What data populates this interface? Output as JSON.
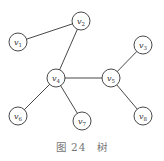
{
  "diagram": {
    "type": "tree",
    "caption": "图 24　树",
    "nodes": [
      {
        "id": "v1",
        "label": "v",
        "sub": "1",
        "x": 18,
        "y": 42
      },
      {
        "id": "v2",
        "label": "v",
        "sub": "2",
        "x": 81,
        "y": 21
      },
      {
        "id": "v3",
        "label": "v",
        "sub": "3",
        "x": 143,
        "y": 45
      },
      {
        "id": "v4",
        "label": "v",
        "sub": "4",
        "x": 56,
        "y": 78
      },
      {
        "id": "v5",
        "label": "v",
        "sub": "5",
        "x": 111,
        "y": 78
      },
      {
        "id": "v6",
        "label": "v",
        "sub": "6",
        "x": 18,
        "y": 116
      },
      {
        "id": "v7",
        "label": "v",
        "sub": "7",
        "x": 82,
        "y": 121
      },
      {
        "id": "v8",
        "label": "v",
        "sub": "8",
        "x": 143,
        "y": 116
      }
    ],
    "edges": [
      [
        "v1",
        "v2"
      ],
      [
        "v2",
        "v4"
      ],
      [
        "v4",
        "v5"
      ],
      [
        "v5",
        "v3"
      ],
      [
        "v4",
        "v6"
      ],
      [
        "v4",
        "v7"
      ],
      [
        "v5",
        "v8"
      ]
    ]
  }
}
